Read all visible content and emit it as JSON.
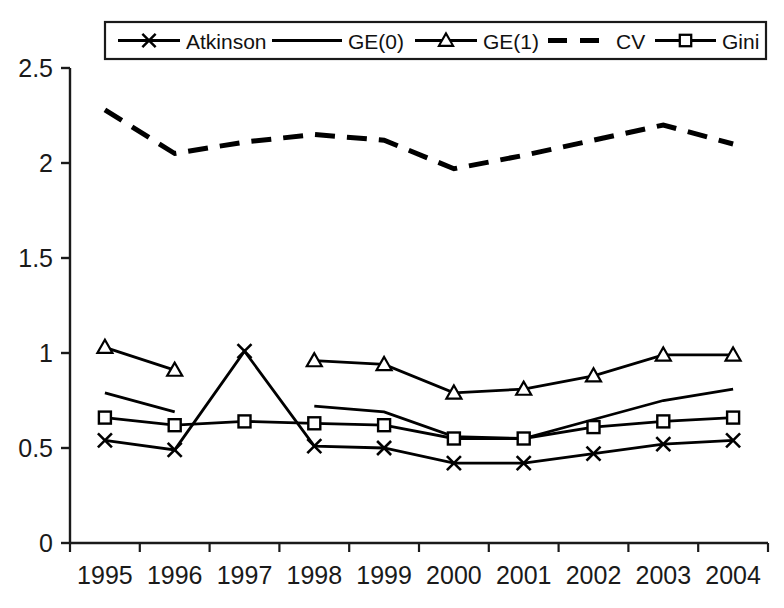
{
  "chart_data": {
    "type": "line",
    "title": "",
    "xlabel": "",
    "ylabel": "",
    "categories": [
      "1995",
      "1996",
      "1997",
      "1998",
      "1999",
      "2000",
      "2001",
      "2002",
      "2003",
      "2004"
    ],
    "ylim": [
      0,
      2.5
    ],
    "xlim_categories": 10,
    "grid": false,
    "legend_position": "top-center",
    "y_ticks": [
      "0",
      "0.5",
      "1",
      "1.5",
      "2",
      "2.5"
    ],
    "y_tick_values": [
      0,
      0.5,
      1,
      1.5,
      2,
      2.5
    ],
    "series": [
      {
        "name": "Atkinson",
        "marker": "x",
        "dash": "solid",
        "color": "#000000",
        "values": [
          0.54,
          0.49,
          1.01,
          0.51,
          0.5,
          0.42,
          0.42,
          0.47,
          0.52,
          0.54
        ]
      },
      {
        "name": "GE(0)",
        "marker": "none",
        "dash": "solid",
        "color": "#000000",
        "values": [
          0.79,
          0.69,
          null,
          0.72,
          0.69,
          0.56,
          0.55,
          0.65,
          0.75,
          0.81
        ]
      },
      {
        "name": "GE(1)",
        "marker": "triangle",
        "dash": "solid",
        "color": "#000000",
        "values": [
          1.03,
          0.91,
          null,
          0.96,
          0.94,
          0.79,
          0.81,
          0.88,
          0.99,
          0.99
        ]
      },
      {
        "name": "CV",
        "marker": "none",
        "dash": "dashed",
        "color": "#000000",
        "values": [
          2.28,
          2.05,
          2.11,
          2.15,
          2.12,
          1.97,
          2.04,
          2.12,
          2.2,
          2.1
        ]
      },
      {
        "name": "Gini",
        "marker": "square",
        "dash": "solid",
        "color": "#000000",
        "values": [
          0.66,
          0.62,
          0.64,
          0.63,
          0.62,
          0.55,
          0.55,
          0.61,
          0.64,
          0.66
        ]
      }
    ]
  },
  "legend": {
    "items": [
      {
        "label": "Atkinson",
        "marker": "x-marker-icon"
      },
      {
        "label": "GE(0)",
        "marker": "line-marker-icon"
      },
      {
        "label": "GE(1)",
        "marker": "triangle-marker-icon"
      },
      {
        "label": "CV",
        "marker": "dashed-line-icon"
      },
      {
        "label": "Gini",
        "marker": "square-marker-icon"
      }
    ]
  }
}
